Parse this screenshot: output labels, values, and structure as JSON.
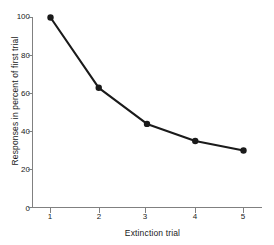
{
  "chart_data": {
    "type": "line",
    "title": "",
    "xlabel": "Extinction trial",
    "ylabel": "Responses in percent of first trial",
    "x": [
      1,
      2,
      3,
      4,
      5
    ],
    "values": [
      100,
      63,
      44,
      35,
      30
    ],
    "xtick_labels": [
      "1",
      "2",
      "3",
      "4",
      "5"
    ],
    "ytick_labels": [
      "0",
      "20",
      "40",
      "60",
      "80",
      "100"
    ],
    "yticks": [
      0,
      20,
      40,
      60,
      80,
      100
    ],
    "xlim": [
      0.6,
      5.5
    ],
    "ylim": [
      0,
      100
    ],
    "grid": false,
    "legend": false,
    "marker": "filled-circle",
    "line_color": "#1a1a1a",
    "marker_color": "#1a1a1a",
    "axis_color": "#808080",
    "background_color": "#ffffff"
  }
}
